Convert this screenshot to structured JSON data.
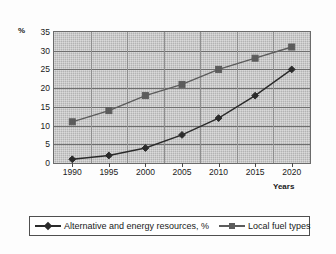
{
  "chart_data": {
    "type": "line",
    "title": "",
    "xlabel": "Years",
    "ylabel": "%",
    "categories": [
      "1990",
      "1995",
      "2000",
      "2005",
      "2010",
      "2015",
      "2020"
    ],
    "ylim": [
      0,
      35
    ],
    "ytick_step": 5,
    "yticks": [
      "35",
      "30",
      "25",
      "20",
      "15",
      "10",
      "5",
      "0"
    ],
    "grid": true,
    "legend_position": "bottom",
    "plot_background": "#b3b3b3",
    "series": [
      {
        "name": "Alternative and energy resources, %",
        "marker": "diamond",
        "color": "#2b2b2b",
        "values": [
          1,
          2,
          4,
          7.5,
          12,
          18,
          25
        ]
      },
      {
        "name": "Local fuel types",
        "marker": "square",
        "color": "#5c5c5c",
        "values": [
          11,
          14,
          18,
          21,
          25,
          28,
          31
        ]
      }
    ]
  },
  "legend": {
    "entries": [
      {
        "label": "Alternative and energy resources, %"
      },
      {
        "label": "Local fuel types"
      }
    ]
  }
}
